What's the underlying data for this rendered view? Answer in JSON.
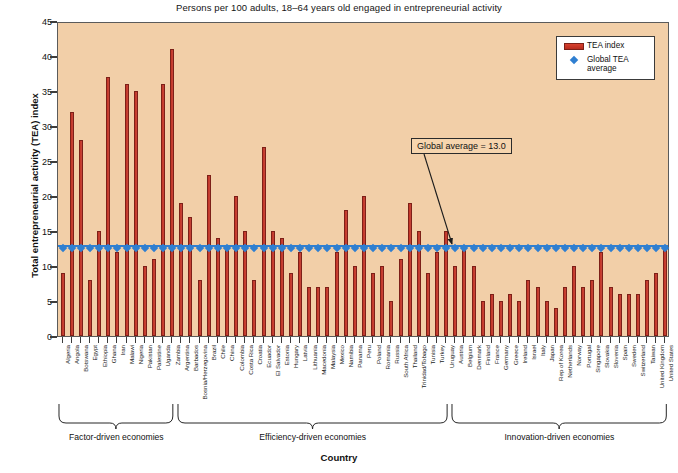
{
  "chart_data": {
    "type": "bar",
    "title": "Persons per 100 adults, 18–64 years old engaged in entrepreneurial activity",
    "xlabel": "Country",
    "ylabel": "Total entrepreneurial activity (TEA) index",
    "ylim": [
      0,
      45
    ],
    "yticks": [
      0,
      5,
      10,
      15,
      20,
      25,
      30,
      35,
      40,
      45
    ],
    "grid": false,
    "legend_position": "top-right",
    "legend": [
      {
        "label": "TEA index",
        "type": "bar",
        "color": "#c0392b"
      },
      {
        "label": "Global TEA average",
        "type": "marker",
        "color": "#2f7fd1"
      }
    ],
    "annotations": [
      {
        "text": "Global average = 13.0",
        "points_to": "global-average-line"
      }
    ],
    "global_average": 13.0,
    "series": [
      {
        "name": "TEA index",
        "color": "#c0392b",
        "categories": [
          "Algeria",
          "Angola",
          "Botswana",
          "Egypt",
          "Ethiopia",
          "Ghana",
          "Iran",
          "Malawi",
          "Nigeria",
          "Pakistan",
          "Palestine",
          "Uganda",
          "Zambia",
          "Argentina",
          "Barbados",
          "Bosnia/Herzegovina",
          "Brazil",
          "Chile",
          "China",
          "Colombia",
          "Costa Rica",
          "Croatia",
          "Ecuador",
          "El Salvador",
          "Estonia",
          "Hungary",
          "Latvia",
          "Lithuania",
          "Macedonia",
          "Malaysia",
          "Mexico",
          "Namibia",
          "Panama",
          "Peru",
          "Poland",
          "Romania",
          "Russia",
          "South Africa",
          "Thailand",
          "Trinidad/Tobago",
          "Tunisia",
          "Turkey",
          "Uruguay",
          "Austria",
          "Belgium",
          "Denmark",
          "Finland",
          "France",
          "Germany",
          "Greece",
          "Ireland",
          "Israel",
          "Italy",
          "Japan",
          "Rep of Korea",
          "Netherlands",
          "Norway",
          "Portugal",
          "Singapore",
          "Slovakia",
          "Slovenia",
          "Spain",
          "Sweden",
          "Switzerland",
          "Taiwan",
          "United Kingdom",
          "United States"
        ],
        "values": [
          9,
          32,
          28,
          8,
          15,
          37,
          12,
          36,
          35,
          10,
          11,
          36,
          41,
          19,
          17,
          8,
          23,
          14,
          13,
          20,
          15,
          8,
          27,
          15,
          14,
          9,
          12,
          7,
          7,
          7,
          12,
          18,
          10,
          20,
          9,
          10,
          5,
          11,
          19,
          15,
          9,
          12,
          15,
          10,
          13,
          10,
          5,
          6,
          5,
          6,
          5,
          8,
          7,
          5,
          4,
          7,
          10,
          7,
          8,
          12,
          7,
          6,
          6,
          6,
          8,
          9,
          13
        ]
      }
    ],
    "groups": [
      {
        "label": "Factor-driven economies",
        "start": "Algeria",
        "end": "Zambia"
      },
      {
        "label": "Efficiency-driven economies",
        "start": "Argentina",
        "end": "Uruguay"
      },
      {
        "label": "Innovation-driven economies",
        "start": "Austria",
        "end": "United States"
      }
    ]
  }
}
